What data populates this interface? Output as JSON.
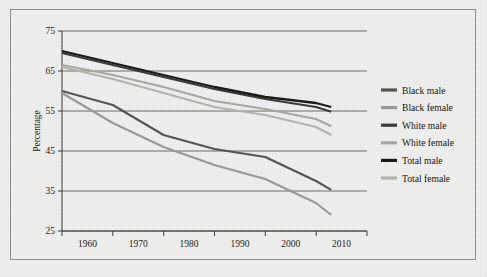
{
  "figure": {
    "background_color": "#eeeeec",
    "frame_color": "#8e8e8c"
  },
  "chart_data": {
    "type": "line",
    "title": "",
    "xlabel": "",
    "ylabel": "Percentage",
    "x": [
      1960,
      1970,
      1980,
      1990,
      2000,
      2010,
      2013
    ],
    "xlim": [
      1960,
      2013
    ],
    "ylim": [
      25,
      75
    ],
    "yticks": [
      25,
      35,
      45,
      55,
      65,
      75
    ],
    "xticks": [
      1960,
      1970,
      1980,
      1990,
      2000,
      2010
    ],
    "grid": true,
    "legend_position": "right",
    "series": [
      {
        "name": "Black male",
        "color": "#55554f",
        "width": 2.1,
        "values": [
          60.0,
          56.5,
          49.0,
          45.5,
          43.5,
          37.5,
          35.3
        ]
      },
      {
        "name": "Black female",
        "color": "#9a9a94",
        "width": 2.1,
        "values": [
          59.5,
          52.0,
          46.0,
          41.5,
          38.0,
          32.0,
          29.0
        ]
      },
      {
        "name": "White male",
        "color": "#3b3b36",
        "width": 2.1,
        "values": [
          69.5,
          66.5,
          63.5,
          60.5,
          58.0,
          56.0,
          54.8
        ]
      },
      {
        "name": "White female",
        "color": "#a8a8a2",
        "width": 2.1,
        "values": [
          66.5,
          64.0,
          61.0,
          57.5,
          55.5,
          53.0,
          51.2
        ]
      },
      {
        "name": "Total male",
        "color": "#1a1a16",
        "width": 2.3,
        "values": [
          70.0,
          67.0,
          64.0,
          61.0,
          58.5,
          57.0,
          56.0
        ]
      },
      {
        "name": "Total female",
        "color": "#b4b4ae",
        "width": 2.1,
        "values": [
          66.0,
          63.0,
          59.5,
          56.0,
          54.0,
          51.0,
          49.0
        ]
      }
    ]
  },
  "axes": {
    "y_title": "Percentage",
    "y_ticklabels": [
      "75",
      "65",
      "55",
      "45",
      "35",
      "25"
    ],
    "x_ticklabels": [
      "1960",
      "1970",
      "1980",
      "1990",
      "2000",
      "2010"
    ]
  },
  "legend": {
    "items": [
      {
        "label": "Black male",
        "color": "#55554f"
      },
      {
        "label": "Black female",
        "color": "#9a9a94"
      },
      {
        "label": "White male",
        "color": "#3b3b36"
      },
      {
        "label": "White female",
        "color": "#a8a8a2"
      },
      {
        "label": "Total male",
        "color": "#1a1a16"
      },
      {
        "label": "Total female",
        "color": "#b4b4ae"
      }
    ]
  }
}
